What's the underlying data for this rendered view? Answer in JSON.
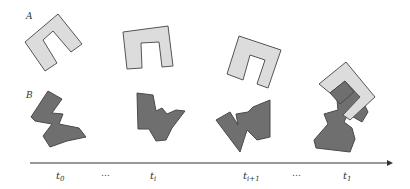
{
  "diagram": {
    "object_labels": {
      "a": "A",
      "b": "B"
    },
    "colors": {
      "object_a_fill": "#dcdcdc",
      "object_b_fill": "#6f6f6f",
      "outline": "#555555",
      "axis": "#333333"
    },
    "timeline": {
      "ticks": [
        {
          "base": "t",
          "sub": "0"
        },
        {
          "base": "…",
          "sub": ""
        },
        {
          "base": "t",
          "sub": "i"
        },
        {
          "base": "t",
          "sub": "i+1"
        },
        {
          "base": "…",
          "sub": ""
        },
        {
          "base": "t",
          "sub": "1"
        }
      ]
    }
  }
}
